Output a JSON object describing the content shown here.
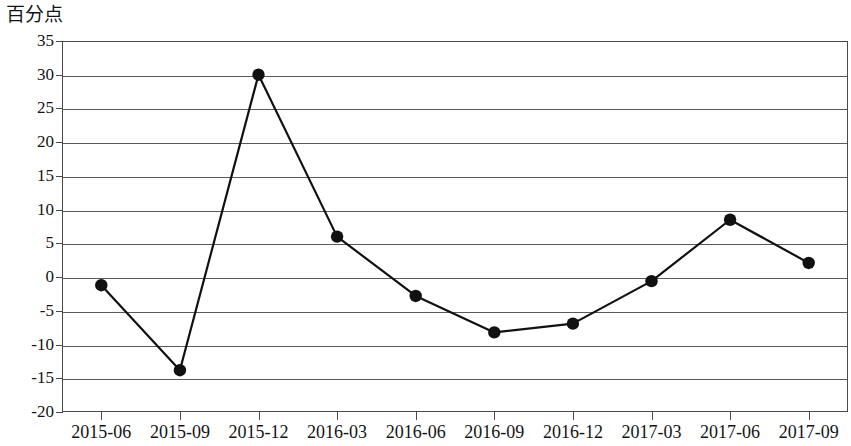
{
  "chart_data": {
    "type": "line",
    "title": "",
    "subtitle": "",
    "xlabel": "",
    "ylabel": "百分点",
    "ylim": [
      -20,
      35
    ],
    "ytick_step": 5,
    "yticks": [
      35,
      30,
      25,
      20,
      15,
      10,
      5,
      0,
      -5,
      -10,
      -15,
      -20
    ],
    "ytick_labels": [
      "35",
      "30",
      "25",
      "20",
      "15",
      "10",
      "5",
      "0",
      "-5",
      "-10",
      "-15",
      "-20"
    ],
    "grid": true,
    "grid_axis": "y",
    "legend": false,
    "legend_position": "none",
    "marker": "filled-circle",
    "marker_color": "#111111",
    "line_color": "#111111",
    "categories": [
      "2015-06",
      "2015-09",
      "2015-12",
      "2016-03",
      "2016-06",
      "2016-09",
      "2016-12",
      "2017-03",
      "2017-06",
      "2017-09"
    ],
    "values": [
      -1.2,
      -13.8,
      30.0,
      6.0,
      -2.8,
      -8.2,
      -6.9,
      -0.6,
      8.5,
      2.1
    ],
    "series": [
      {
        "name": "",
        "values": [
          -1.2,
          -13.8,
          30.0,
          6.0,
          -2.8,
          -8.2,
          -6.9,
          -0.6,
          8.5,
          2.1
        ]
      }
    ]
  },
  "axis": {
    "unit_label": "百分点"
  },
  "colors": {
    "line": "#111111",
    "marker": "#111111",
    "grid": "#5a5a5a",
    "frame": "#4a4a4a",
    "background": "#ffffff",
    "text": "#141414"
  }
}
